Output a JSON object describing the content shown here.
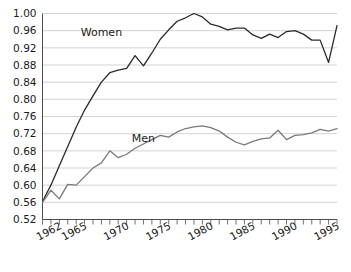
{
  "chart_data": {
    "type": "line",
    "title": "",
    "subtitle": "",
    "xlabel": "",
    "ylabel": "",
    "xlim": [
      1962,
      1997
    ],
    "ylim": [
      0.52,
      1.0
    ],
    "grid": true,
    "grid_axis": "y",
    "legend_position": "inline-labels",
    "y_ticks": [
      "0.52",
      "0.56",
      "0.60",
      "0.64",
      "0.68",
      "0.72",
      "0.76",
      "0.80",
      "0.84",
      "0.88",
      "0.92",
      "0.96",
      "1.00"
    ],
    "y_tick_values": [
      0.52,
      0.56,
      0.6,
      0.64,
      0.68,
      0.72,
      0.76,
      0.8,
      0.84,
      0.88,
      0.92,
      0.96,
      1.0
    ],
    "x_ticks": [
      "1962",
      "1965",
      "1970",
      "1975",
      "1980",
      "1985",
      "1990",
      "1995"
    ],
    "x_tick_values": [
      1962,
      1965,
      1970,
      1975,
      1980,
      1985,
      1990,
      1995
    ],
    "x": [
      1962,
      1963,
      1964,
      1965,
      1966,
      1967,
      1968,
      1969,
      1970,
      1971,
      1972,
      1973,
      1974,
      1975,
      1976,
      1977,
      1978,
      1979,
      1980,
      1981,
      1982,
      1983,
      1984,
      1985,
      1986,
      1987,
      1988,
      1989,
      1990,
      1991,
      1992,
      1993,
      1994,
      1995,
      1996,
      1997
    ],
    "series": [
      {
        "name": "Women",
        "color": "#2b2b2b",
        "label_x": 1969,
        "label_y": 0.948,
        "values": [
          0.562,
          0.6,
          0.645,
          0.69,
          0.735,
          0.775,
          0.808,
          0.84,
          0.862,
          0.868,
          0.872,
          0.902,
          0.878,
          0.908,
          0.94,
          0.962,
          0.982,
          0.99,
          1.0,
          0.992,
          0.975,
          0.97,
          0.962,
          0.966,
          0.966,
          0.95,
          0.942,
          0.952,
          0.944,
          0.958,
          0.96,
          0.952,
          0.938,
          0.938,
          0.886,
          0.972
        ]
      },
      {
        "name": "Men",
        "color": "#7a7a7a",
        "label_x": 1974,
        "label_y": 0.7,
        "values": [
          0.56,
          0.588,
          0.568,
          0.602,
          0.6,
          0.62,
          0.64,
          0.652,
          0.68,
          0.664,
          0.672,
          0.686,
          0.696,
          0.706,
          0.716,
          0.712,
          0.724,
          0.732,
          0.736,
          0.738,
          0.734,
          0.726,
          0.712,
          0.7,
          0.694,
          0.702,
          0.708,
          0.71,
          0.728,
          0.706,
          0.716,
          0.718,
          0.722,
          0.73,
          0.726,
          0.732
        ]
      }
    ]
  },
  "axes": {
    "y_axis_name": "y-axis",
    "x_axis_name": "x-axis"
  }
}
